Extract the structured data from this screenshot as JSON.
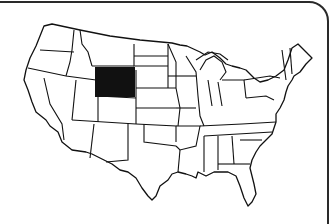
{
  "map": {
    "subject": "Contiguous United States outline map",
    "highlighted_state": "Wyoming",
    "highlight_color": "#111111",
    "state_fill": "#ffffff",
    "border_color": "#111111",
    "background": "#ffffff",
    "frame_color": "#2a2a2a"
  }
}
